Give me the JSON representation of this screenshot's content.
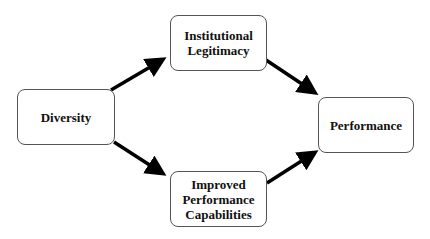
{
  "diagram": {
    "type": "flow",
    "nodes": [
      {
        "id": "diversity",
        "label": "Diversity"
      },
      {
        "id": "legitimacy",
        "label": "Institutional\nLegitimacy"
      },
      {
        "id": "capabilities",
        "label": "Improved\nPerformance\nCapabilities"
      },
      {
        "id": "performance",
        "label": "Performance"
      }
    ],
    "edges": [
      {
        "from": "diversity",
        "to": "legitimacy"
      },
      {
        "from": "diversity",
        "to": "capabilities"
      },
      {
        "from": "legitimacy",
        "to": "performance"
      },
      {
        "from": "capabilities",
        "to": "performance"
      }
    ],
    "colors": {
      "arrow": "#000000",
      "border": "#555555",
      "text": "#111111",
      "background": "#ffffff"
    }
  }
}
